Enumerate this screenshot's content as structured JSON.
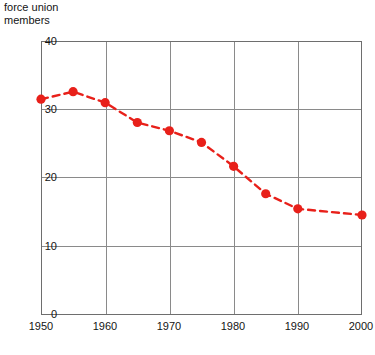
{
  "title": {
    "line1": "force union",
    "line2": "members"
  },
  "chart_data": {
    "type": "line",
    "title": "force union members",
    "subtitle": "",
    "xlabel": "",
    "ylabel": "",
    "x": [
      1950,
      1955,
      1960,
      1965,
      1970,
      1975,
      1980,
      1985,
      1990,
      2000
    ],
    "values": [
      31.5,
      32.6,
      31.0,
      28.1,
      26.9,
      25.2,
      21.7,
      17.7,
      15.5,
      14.6
    ],
    "series": [
      {
        "name": "force union members",
        "values": [
          31.5,
          32.6,
          31.0,
          28.1,
          26.9,
          25.2,
          21.7,
          17.7,
          15.5,
          14.6
        ]
      }
    ],
    "xlim": [
      1950,
      2000
    ],
    "ylim": [
      0,
      40
    ],
    "xticks": [
      1950,
      1960,
      1970,
      1980,
      1990,
      2000
    ],
    "xticklabels": [
      "1950",
      "1960",
      "1970",
      "1980",
      "1990",
      "2000"
    ],
    "yticks": [
      0,
      10,
      20,
      30,
      40
    ],
    "yticklabels": [
      "0",
      "10",
      "20",
      "30",
      "40"
    ],
    "grid": true,
    "grid_axes": "both",
    "legend": "none",
    "line_style": "dashed",
    "marker": "circle",
    "colors": {
      "series": "#e8201a",
      "grid": "#8a8a8a",
      "frame": "#6e6e6e",
      "text": "#141414",
      "background": "#ffffff"
    }
  }
}
